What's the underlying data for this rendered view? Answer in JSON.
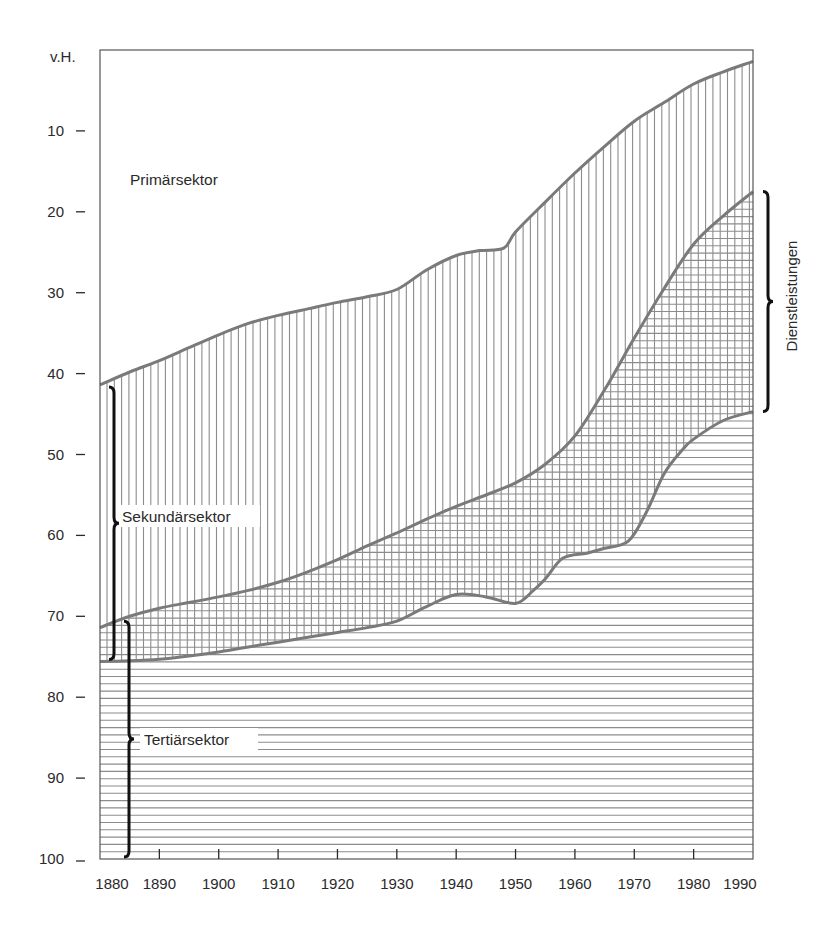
{
  "chart_data": {
    "type": "area",
    "title": "",
    "xlabel": "",
    "ylabel": "v.H.",
    "xlim": [
      1880,
      1990
    ],
    "ylim": [
      0,
      100
    ],
    "y_inverted": true,
    "grid": false,
    "y_ticks": [
      10,
      20,
      30,
      40,
      50,
      60,
      70,
      80,
      90,
      100
    ],
    "x_ticks": [
      1880,
      1890,
      1900,
      1910,
      1920,
      1930,
      1940,
      1950,
      1960,
      1970,
      1980,
      1990
    ],
    "boundaries": [
      {
        "name": "Primärsektor / Sekundärsektor",
        "points": [
          [
            1880,
            41.4
          ],
          [
            1885,
            39.8
          ],
          [
            1890,
            38.4
          ],
          [
            1895,
            36.8
          ],
          [
            1900,
            35.2
          ],
          [
            1905,
            33.8
          ],
          [
            1910,
            32.8
          ],
          [
            1915,
            32.0
          ],
          [
            1920,
            31.2
          ],
          [
            1925,
            30.5
          ],
          [
            1930,
            29.6
          ],
          [
            1935,
            27.2
          ],
          [
            1940,
            25.4
          ],
          [
            1944,
            24.8
          ],
          [
            1948,
            24.5
          ],
          [
            1950,
            22.5
          ],
          [
            1955,
            18.8
          ],
          [
            1960,
            15.2
          ],
          [
            1965,
            11.9
          ],
          [
            1970,
            8.8
          ],
          [
            1975,
            6.5
          ],
          [
            1980,
            4.2
          ],
          [
            1985,
            2.7
          ],
          [
            1990,
            1.4
          ]
        ]
      },
      {
        "name": "Sekundärsektor / Tertiärsektor",
        "points": [
          [
            1880,
            71.4
          ],
          [
            1885,
            70.0
          ],
          [
            1890,
            69.0
          ],
          [
            1895,
            68.3
          ],
          [
            1900,
            67.6
          ],
          [
            1905,
            66.8
          ],
          [
            1910,
            65.8
          ],
          [
            1915,
            64.5
          ],
          [
            1920,
            63.0
          ],
          [
            1925,
            61.3
          ],
          [
            1930,
            59.7
          ],
          [
            1935,
            58.0
          ],
          [
            1940,
            56.4
          ],
          [
            1945,
            55.0
          ],
          [
            1950,
            53.5
          ],
          [
            1955,
            51.2
          ],
          [
            1960,
            47.7
          ],
          [
            1965,
            42.0
          ],
          [
            1970,
            35.6
          ],
          [
            1975,
            29.5
          ],
          [
            1980,
            24.0
          ],
          [
            1985,
            20.5
          ],
          [
            1990,
            17.5
          ]
        ]
      },
      {
        "name": "Tertiärsektor (lower boundary of Dienstleistungen)",
        "points": [
          [
            1880,
            75.6
          ],
          [
            1885,
            75.5
          ],
          [
            1890,
            75.3
          ],
          [
            1895,
            74.9
          ],
          [
            1900,
            74.4
          ],
          [
            1905,
            73.8
          ],
          [
            1910,
            73.2
          ],
          [
            1915,
            72.6
          ],
          [
            1920,
            72.0
          ],
          [
            1925,
            71.4
          ],
          [
            1930,
            70.6
          ],
          [
            1935,
            68.8
          ],
          [
            1940,
            67.3
          ],
          [
            1945,
            67.6
          ],
          [
            1950,
            68.4
          ],
          [
            1953,
            66.8
          ],
          [
            1955,
            65.4
          ],
          [
            1958,
            62.8
          ],
          [
            1962,
            62.2
          ],
          [
            1965,
            61.6
          ],
          [
            1969,
            60.7
          ],
          [
            1972,
            57.2
          ],
          [
            1975,
            52.4
          ],
          [
            1978,
            49.5
          ],
          [
            1980,
            48.1
          ],
          [
            1985,
            45.8
          ],
          [
            1990,
            44.7
          ]
        ]
      }
    ],
    "series": [
      {
        "name": "Primärsektor",
        "region": "0 to boundary 1",
        "values_share_pct_at": {
          "1880": 41.4,
          "1950": 22.5,
          "1990": 1.4
        }
      },
      {
        "name": "Sekundärsektor",
        "region": "boundary 1 to boundary 2",
        "values_share_pct_at": {
          "1880": 30.0,
          "1950": 31.0,
          "1990": 16.1
        }
      },
      {
        "name": "Tertiärsektor",
        "region": "boundary 2 to 100",
        "values_share_pct_at": {
          "1880": 28.6,
          "1950": 46.5,
          "1990": 82.5
        }
      }
    ],
    "annotations": [
      {
        "text": "Primärsektor",
        "x": 1885,
        "y": 16
      },
      {
        "text": "Sekundärsektor",
        "bracket_from": 41.4,
        "bracket_to": 75.6,
        "side": "left"
      },
      {
        "text": "Tertiärsektor",
        "bracket_from": 70.6,
        "bracket_to": 100,
        "side": "left"
      },
      {
        "text": "Dienstleistungen",
        "bracket_from": 17.5,
        "bracket_to": 44.7,
        "side": "right",
        "rotated": true
      }
    ]
  },
  "labels": {
    "y_unit": "v.H.",
    "primary": "Primärsektor",
    "secondary": "Sekundärsektor",
    "tertiary": "Tertiärsektor",
    "services": "Dienstleistungen"
  },
  "colors": {
    "curve": "#7a7a7a",
    "hatch": "#8c8c8c",
    "frame": "#555555",
    "bracket": "#111111",
    "text": "#2a2a2a"
  }
}
